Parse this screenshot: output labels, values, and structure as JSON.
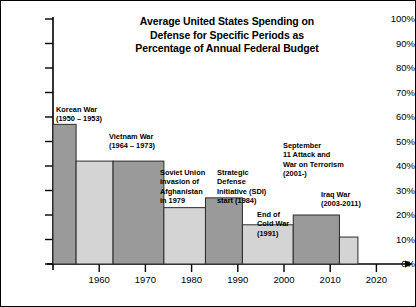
{
  "chart_data": {
    "type": "bar",
    "title": "Average United States Spending on\nDefense for Specific Periods as\nPercentage of Annual Federal Budget",
    "title_line_1": "Average United States Spending on",
    "title_line_2": "Defense for Specific Periods as",
    "title_line_3": "Percentage of Annual Federal Budget",
    "xlabel": "",
    "ylabel": "",
    "xlim": [
      1950,
      2022
    ],
    "ylim": [
      0,
      100
    ],
    "grid": false,
    "legend": "none",
    "y_ticks": [
      "0%",
      "10%",
      "20%",
      "30%",
      "40%",
      "50%",
      "60%",
      "70%",
      "80%",
      "90%",
      "100%"
    ],
    "y_tick_values": [
      0,
      10,
      20,
      30,
      40,
      50,
      60,
      70,
      80,
      90,
      100
    ],
    "x_ticks": [
      "1960",
      "1970",
      "1980",
      "1990",
      "2000",
      "2010",
      "2020"
    ],
    "x_tick_values": [
      1960,
      1970,
      1980,
      1990,
      2000,
      2010,
      2020
    ],
    "bars": [
      {
        "label": "Korean War (1950 – 1953)",
        "x_start": 1950,
        "x_end": 1955,
        "value": 57,
        "shade": "dark"
      },
      {
        "label": "",
        "x_start": 1955,
        "x_end": 1963,
        "value": 42,
        "shade": "light"
      },
      {
        "label": "Vietnam War (1964 – 1973)",
        "x_start": 1963,
        "x_end": 1974,
        "value": 42,
        "shade": "dark"
      },
      {
        "label": "Soviet Union invasion of Afghanistan in 1979",
        "x_start": 1974,
        "x_end": 1983,
        "value": 23,
        "shade": "light"
      },
      {
        "label": "Strategic Defense Initiative (SDI) start (1984)",
        "x_start": 1983,
        "x_end": 1991,
        "value": 27,
        "shade": "dark"
      },
      {
        "label": "End of Cold War (1991)",
        "x_start": 1991,
        "x_end": 2002,
        "value": 16,
        "shade": "light"
      },
      {
        "label": "Iraq War (2003-2011)",
        "x_start": 2002,
        "x_end": 2012,
        "value": 20,
        "shade": "dark"
      },
      {
        "label": "",
        "x_start": 2012,
        "x_end": 2016,
        "value": 11,
        "shade": "light"
      }
    ],
    "annotations": [
      {
        "name": "korean-war",
        "text": "Korean War\n(1950 – 1953)"
      },
      {
        "name": "vietnam-war",
        "text": "Vietnam War\n(1964 – 1973)"
      },
      {
        "name": "soviet-afghanistan",
        "text": "Soviet Union\ninvasion of\nAfghanistan\nin 1979"
      },
      {
        "name": "sdi-start",
        "text": "Strategic\nDefense\nInitiative (SDI)\nstart (1984)"
      },
      {
        "name": "september-11",
        "text": "September\n11 Attack and\nWar on Terrorism\n(2001-)"
      },
      {
        "name": "end-of-cold-war",
        "text": "End of\nCold War\n(1991)"
      },
      {
        "name": "iraq-war",
        "text": "Iraq War\n(2003-2011)"
      }
    ],
    "colors": {
      "bar_dark": "#9a9a9a",
      "bar_light": "#d4d4d4",
      "axis": "#000000",
      "text": "#000000",
      "background": "#ffffff"
    }
  }
}
